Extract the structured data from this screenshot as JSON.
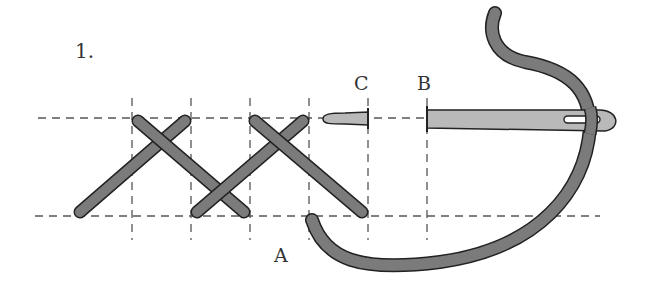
{
  "diagram": {
    "step_number": "1.",
    "labels": {
      "a": "A",
      "b": "B",
      "c": "C"
    },
    "colors": {
      "thread": "#7b7b7b",
      "needle": "#b9b9b9",
      "outline": "#222222",
      "guide": "#555555"
    },
    "guides": {
      "horizontal_y": [
        118,
        216
      ],
      "vertical_x": [
        132,
        191,
        250,
        309,
        368,
        427
      ]
    }
  }
}
